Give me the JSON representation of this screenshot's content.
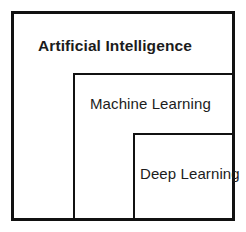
{
  "diagram": {
    "type": "nested-containment",
    "background_color": "#ffffff",
    "stroke_color": "#111111",
    "text_color": "#1c1c1c",
    "levels": [
      {
        "id": "artificial-intelligence",
        "label": "Artificial Intelligence",
        "depth": 0,
        "emphasis": "bold",
        "border_width_px": 3,
        "box": {
          "x": 11,
          "y": 11,
          "width": 224,
          "height": 210
        },
        "label_position": {
          "x": 38,
          "y": 38
        }
      },
      {
        "id": "machine-learning",
        "label": "Machine Learning",
        "depth": 1,
        "emphasis": "regular",
        "border_width_px": 2,
        "box": {
          "x": 73,
          "y": 73,
          "width": 162,
          "height": 148
        },
        "label_position": {
          "x": 90,
          "y": 96
        }
      },
      {
        "id": "deep-learning",
        "label": "Deep Learning",
        "depth": 2,
        "emphasis": "regular",
        "border_width_px": 2,
        "box": {
          "x": 133,
          "y": 133,
          "width": 102,
          "height": 88
        },
        "label_position": {
          "x": 140,
          "y": 166
        }
      }
    ]
  }
}
